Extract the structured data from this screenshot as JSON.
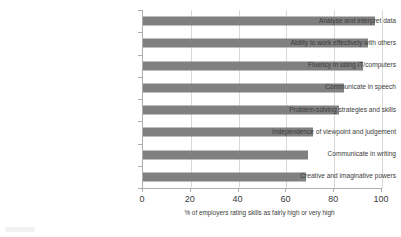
{
  "chart_data": {
    "type": "bar",
    "orientation": "horizontal",
    "title": "",
    "subtitle": "",
    "categories": [
      "Analyse and interpret data",
      "Ability to work effectively with others",
      "Fluency in using IT/computers",
      "Communicate in speech",
      "Problem-solving strategies and skills",
      "Independence of viewpoint and judgement",
      "Communicate in writing",
      "Creative and imaginative powers"
    ],
    "values": [
      97,
      94,
      92,
      84,
      82,
      71,
      69,
      68
    ],
    "xlabel": "% of employers rating skills as fairly high or very high",
    "ylabel": "",
    "xlim": [
      0,
      100
    ],
    "xticks": [
      0,
      20,
      40,
      60,
      80,
      100
    ],
    "xtick_labels": [
      "0",
      "20",
      "40",
      "60",
      "80",
      "100"
    ],
    "grid": "vertical-only",
    "legend": "none",
    "bar_color": "#808080",
    "grid_color": "#d9d9d9",
    "axis_color": "#aeaeae",
    "background_color": "#ffffff",
    "text_color": "#3b3b3b"
  }
}
